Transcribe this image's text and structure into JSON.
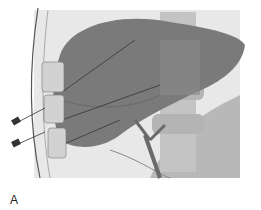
{
  "figure": {
    "panel_label": "A",
    "colors": {
      "background": "#ffffff",
      "panel_bg": "#e6e6e6",
      "liver": "#7c7c7c",
      "liver_dark": "#6a6a6a",
      "spine": "#bdbdbd",
      "pledget": "#cfcfcf",
      "tissue": "#b5b5b5"
    }
  }
}
